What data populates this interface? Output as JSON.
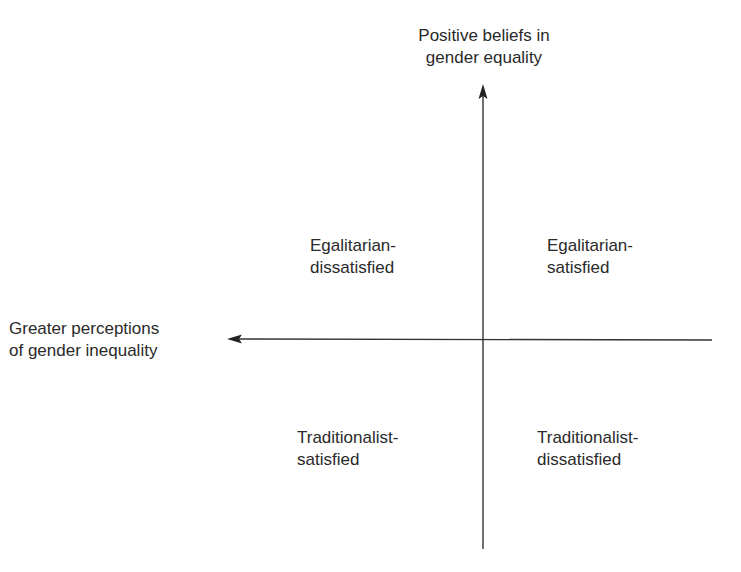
{
  "diagram": {
    "type": "quadrant",
    "y_axis": {
      "label_line1": "Positive beliefs in",
      "label_line2": "gender equality",
      "direction": "up"
    },
    "x_axis": {
      "label_line1": "Greater perceptions",
      "label_line2": "of gender inequality",
      "direction": "left"
    },
    "quadrants": {
      "top_left": {
        "line1": "Egalitarian-",
        "line2": "dissatisfied"
      },
      "top_right": {
        "line1": "Egalitarian-",
        "line2": "satisfied"
      },
      "bottom_left": {
        "line1": "Traditionalist-",
        "line2": "satisfied"
      },
      "bottom_right": {
        "line1": "Traditionalist-",
        "line2": "dissatisfied"
      }
    },
    "colors": {
      "line": "#333333",
      "text": "#2a2a2a",
      "background": "#ffffff"
    }
  }
}
